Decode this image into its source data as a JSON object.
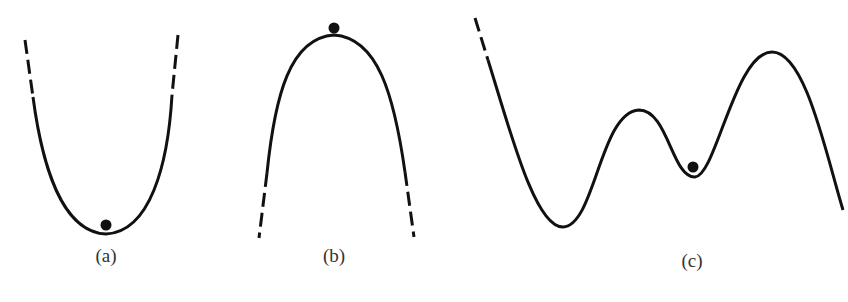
{
  "figure": {
    "panels": [
      {
        "id": "a",
        "label": "(a)",
        "shape": "U-shaped well (minimum)",
        "ball_position": "bottom of well",
        "equilibrium": "stable"
      },
      {
        "id": "b",
        "label": "(b)",
        "shape": "inverted U (maximum)",
        "ball_position": "top of hill",
        "equilibrium": "unstable"
      },
      {
        "id": "c",
        "label": "(c)",
        "shape": "multi-well curve with two peaks and two valleys",
        "ball_position": "shallow local minimum between peaks",
        "equilibrium": "metastable"
      }
    ],
    "colors": {
      "stroke": "#111111",
      "label": "#333333",
      "background": "#ffffff"
    }
  }
}
